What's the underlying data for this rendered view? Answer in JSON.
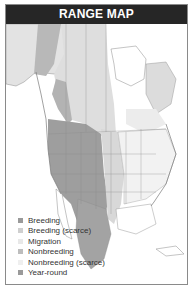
{
  "header": {
    "title": "RANGE MAP"
  },
  "legend": {
    "items": [
      {
        "label": "Breeding",
        "color": "#9a9a9a"
      },
      {
        "label": "Breeding (scarce)",
        "color": "#cfcfcf"
      },
      {
        "label": "Migration",
        "color": "#e8e8e8"
      },
      {
        "label": "Nonbreeding",
        "color": "#bdbdbd"
      },
      {
        "label": "Nonbreeding (scarce)",
        "color": "#efefef"
      },
      {
        "label": "Year-round",
        "color": "#9a9a9a"
      }
    ]
  },
  "colors": {
    "header_bg": "#262626",
    "header_text": "#ffffff",
    "land": "#ffffff",
    "year_round": "#9a9a9a",
    "breeding": "#b5b5b5",
    "migration": "#e6e6e6",
    "border_lines": "#7a7a7a"
  }
}
